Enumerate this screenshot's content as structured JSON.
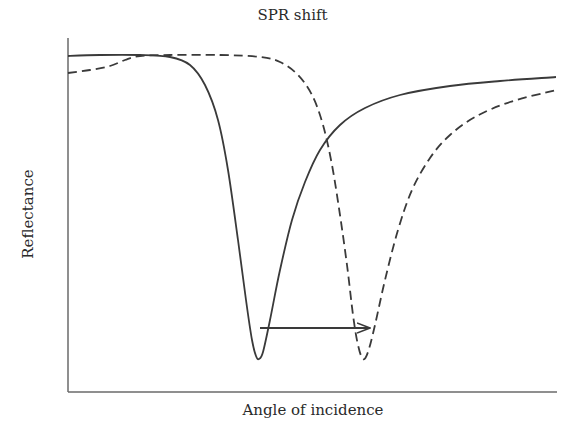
{
  "chart_data": {
    "type": "line",
    "title": "SPR shift",
    "xlabel": "Angle of incidence",
    "ylabel": "Reflectance",
    "grid": false,
    "legend": null,
    "axis_ticks": false,
    "x_range_px": [
      68,
      557
    ],
    "y_range_px": [
      38,
      392
    ],
    "series": [
      {
        "name": "before shift",
        "style": "solid",
        "color": "#3a3a3a",
        "points_px": [
          [
            68,
            56
          ],
          [
            100,
            55
          ],
          [
            140,
            55
          ],
          [
            170,
            57
          ],
          [
            190,
            65
          ],
          [
            205,
            85
          ],
          [
            218,
            120
          ],
          [
            228,
            170
          ],
          [
            238,
            240
          ],
          [
            246,
            300
          ],
          [
            252,
            340
          ],
          [
            256,
            356
          ],
          [
            259,
            359
          ],
          [
            263,
            352
          ],
          [
            270,
            320
          ],
          [
            280,
            270
          ],
          [
            292,
            220
          ],
          [
            305,
            182
          ],
          [
            320,
            150
          ],
          [
            340,
            125
          ],
          [
            365,
            108
          ],
          [
            400,
            95
          ],
          [
            450,
            86
          ],
          [
            500,
            81
          ],
          [
            556,
            77
          ]
        ],
        "minimum_px": [
          258,
          359
        ]
      },
      {
        "name": "after shift",
        "style": "dashed",
        "color": "#3a3a3a",
        "points_px": [
          [
            68,
            73
          ],
          [
            90,
            70
          ],
          [
            110,
            66
          ],
          [
            125,
            60
          ],
          [
            140,
            56
          ],
          [
            170,
            55
          ],
          [
            220,
            55
          ],
          [
            260,
            57
          ],
          [
            280,
            62
          ],
          [
            298,
            75
          ],
          [
            312,
            95
          ],
          [
            323,
            125
          ],
          [
            332,
            165
          ],
          [
            340,
            215
          ],
          [
            347,
            265
          ],
          [
            353,
            315
          ],
          [
            358,
            345
          ],
          [
            363,
            359
          ],
          [
            368,
            352
          ],
          [
            375,
            325
          ],
          [
            385,
            280
          ],
          [
            398,
            230
          ],
          [
            412,
            190
          ],
          [
            430,
            158
          ],
          [
            450,
            135
          ],
          [
            475,
            117
          ],
          [
            510,
            102
          ],
          [
            556,
            90
          ]
        ],
        "minimum_px": [
          363,
          359
        ]
      }
    ],
    "annotations": [
      {
        "type": "arrow",
        "direction": "right",
        "from_px": [
          260,
          328
        ],
        "to_px": [
          370,
          328
        ],
        "meaning": "resonance dip shifts to larger angle"
      }
    ]
  }
}
